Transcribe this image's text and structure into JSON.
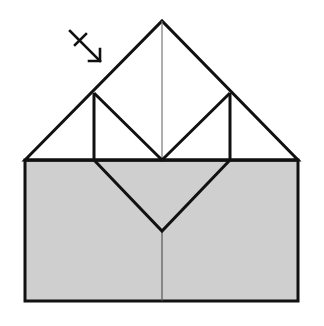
{
  "diagram": {
    "type": "origami-fold-step",
    "colors": {
      "background": "#ffffff",
      "paper_back": "#cfcfcf",
      "paper_front": "#ffffff",
      "line": "#111111",
      "crease": "#777777"
    },
    "paper": {
      "rectangle": {
        "x": 25,
        "y": 160,
        "width": 273,
        "height": 141
      },
      "apex": {
        "x": 162,
        "y": 21
      },
      "left_shoulder": {
        "x": 94,
        "y": 93
      },
      "right_shoulder": {
        "x": 230,
        "y": 93
      },
      "center_fold_point": {
        "x": 162,
        "y": 160
      },
      "lower_v_point": {
        "x": 162,
        "y": 231
      }
    },
    "annotations": [
      {
        "kind": "fold-arrow",
        "label": "turn-over arrow",
        "direction": "down-right"
      }
    ]
  }
}
